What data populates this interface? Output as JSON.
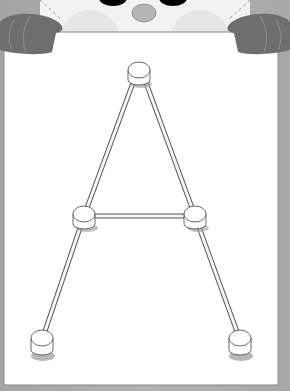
{
  "illustration": {
    "title": "Letter A connect-the-pegs worksheet",
    "letter": "A",
    "character": "panda-peeking-over-board",
    "colors": {
      "background": "#a9a9a9",
      "board": "#ffffff",
      "paws": "#6e6e6e",
      "face": "#f2f2f2",
      "eyes": "#000000",
      "nose": "#b5b5b5",
      "rods": "#f5f5f5",
      "outline": "#555555"
    },
    "pegs": [
      {
        "id": "apex",
        "x": 139,
        "y": 72
      },
      {
        "id": "left-mid",
        "x": 84,
        "y": 216
      },
      {
        "id": "right-mid",
        "x": 195,
        "y": 216
      },
      {
        "id": "left-foot",
        "x": 42,
        "y": 340
      },
      {
        "id": "right-foot",
        "x": 240,
        "y": 340
      }
    ]
  }
}
